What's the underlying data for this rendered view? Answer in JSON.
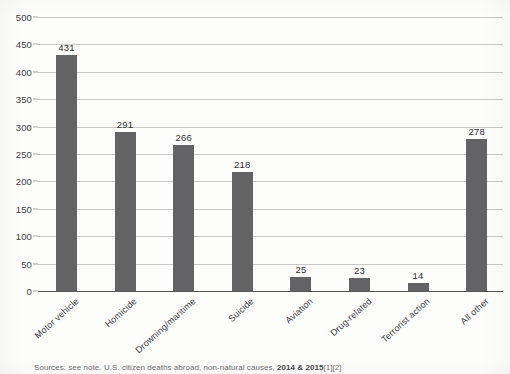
{
  "chart_data": {
    "type": "bar",
    "title": "",
    "subtitle": "",
    "xlabel": "",
    "ylabel": "",
    "ylim": [
      0,
      500
    ],
    "ytick_step": 50,
    "yticks": [
      "0",
      "50",
      "100",
      "150",
      "200",
      "250",
      "300",
      "350",
      "400",
      "450",
      "500"
    ],
    "grid": true,
    "legend": null,
    "categories": [
      "Motor vehicle",
      "Homicide",
      "Drowning/maritime",
      "Suicide",
      "Aviation",
      "Drug-related",
      "Terrorist action",
      "All other"
    ],
    "values": [
      431,
      291,
      266,
      218,
      25,
      23,
      14,
      278
    ],
    "value_labels": [
      "431",
      "291",
      "266",
      "218",
      "25",
      "23",
      "14",
      "278"
    ],
    "bar_color": "#636365",
    "gridline_color": "#c9c9c9",
    "axis_color": "#58585a",
    "background_color": "#fdfdfc",
    "label_rotation_degrees": -42
  },
  "caption": {
    "text": "cut-off source note"
  }
}
